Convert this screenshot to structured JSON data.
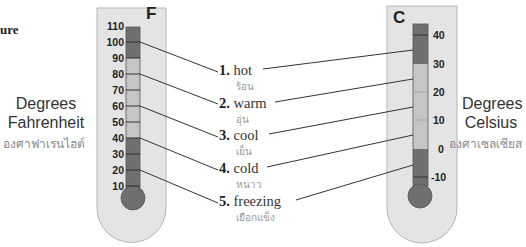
{
  "header": {
    "partial_title": "ure"
  },
  "fahrenheit": {
    "unit_letter": "F",
    "label_line1": "Degrees",
    "label_line2": "Fahrenheit",
    "label_thai": "องศาฟาเรนไฮต์",
    "ticks": [
      "110",
      "100",
      "90",
      "80",
      "70",
      "60",
      "50",
      "40",
      "30",
      "20",
      "10"
    ]
  },
  "celsius": {
    "unit_letter": "C",
    "label_line1": "Degrees",
    "label_line2": "Celsius",
    "label_thai": "องศาเซลเซียส",
    "ticks": [
      "40",
      "30",
      "20",
      "10",
      "0",
      "-10"
    ]
  },
  "terms": [
    {
      "num": "1.",
      "en": "hot",
      "th": "ร้อน"
    },
    {
      "num": "2.",
      "en": "warm",
      "th": "อุ่น"
    },
    {
      "num": "3.",
      "en": "cool",
      "th": "เย็น"
    },
    {
      "num": "4.",
      "en": "cold",
      "th": "หนาว"
    },
    {
      "num": "5.",
      "en": "freezing",
      "th": "เยือกแข็ง"
    }
  ],
  "colors": {
    "body_fill": "#e4e4e4",
    "body_stroke": "#b5b5b5",
    "tube_dark": "#6f6f6f",
    "tube_light": "#c5c5c5",
    "line": "#333333"
  }
}
